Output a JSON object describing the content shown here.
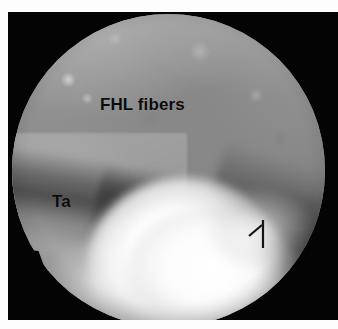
{
  "figure": {
    "kind": "arthroscopic-photograph",
    "modality": "arthroscopy",
    "view": "circular endoscopic field of view",
    "background_color": "#ffffff",
    "frame_color": "#040404"
  },
  "image": {
    "field_shape": "circle",
    "field_diameter_px": 313,
    "field_center": "168,166",
    "dominant_tone": "#909090",
    "highlight_tone": "#ffffff",
    "shadow_tone": "#3c3c3c"
  },
  "annotations": {
    "labels": [
      {
        "id": "fhl",
        "text": "FHL fibers",
        "color": "#0b0b0b",
        "x": 92,
        "y": 84
      },
      {
        "id": "ta",
        "text": "Ta",
        "color": "#0b0b0b",
        "x": 44,
        "y": 181
      }
    ],
    "markers": [
      {
        "id": "arrow",
        "name": "arrow-marker",
        "color": "#1a1a1a",
        "x": 238,
        "y": 206
      }
    ]
  },
  "regions": {
    "upper_tissue": "FHL fibers",
    "left_tissue": "Ta",
    "bright_region": "overexposed glare"
  }
}
